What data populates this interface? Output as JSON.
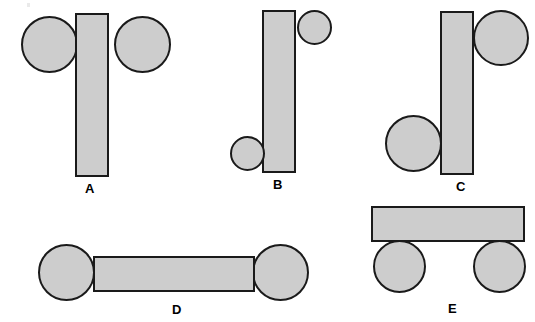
{
  "figure": {
    "title": "",
    "width": 535,
    "height": 322,
    "background_color": "#ffffff",
    "shape_fill_color": "#cdcdcd",
    "shape_outline_color": "#1a1a1a",
    "label_color": "#000000",
    "panels": [
      {
        "id": "A",
        "label": "A",
        "label_x": 85,
        "label_y": 182,
        "shapes": [
          {
            "name": "panel-a-left-circle",
            "type": "circle",
            "x": 21,
            "y": 16,
            "w": 57,
            "h": 57
          },
          {
            "name": "panel-a-right-circle",
            "type": "circle",
            "x": 114,
            "y": 16,
            "w": 57,
            "h": 57
          },
          {
            "name": "panel-a-bar",
            "type": "rect",
            "x": 75,
            "y": 13,
            "w": 34,
            "h": 164
          }
        ]
      },
      {
        "id": "B",
        "label": "B",
        "label_x": 273,
        "label_y": 178,
        "shapes": [
          {
            "name": "panel-b-bar",
            "type": "rect",
            "x": 262,
            "y": 10,
            "w": 34,
            "h": 163
          },
          {
            "name": "panel-b-top-right-circle",
            "type": "circle",
            "x": 297,
            "y": 10,
            "w": 35,
            "h": 35
          },
          {
            "name": "panel-b-bottom-left-circle",
            "type": "circle",
            "x": 230,
            "y": 136,
            "w": 35,
            "h": 35
          }
        ]
      },
      {
        "id": "C",
        "label": "C",
        "label_x": 456,
        "label_y": 180,
        "shapes": [
          {
            "name": "panel-c-bar",
            "type": "rect",
            "x": 440,
            "y": 11,
            "w": 34,
            "h": 164
          },
          {
            "name": "panel-c-top-right-circle",
            "type": "circle",
            "x": 473,
            "y": 10,
            "w": 56,
            "h": 56
          },
          {
            "name": "panel-c-bottom-left-circle",
            "type": "circle",
            "x": 385,
            "y": 115,
            "w": 57,
            "h": 57
          }
        ]
      },
      {
        "id": "D",
        "label": "D",
        "label_x": 172,
        "label_y": 303,
        "shapes": [
          {
            "name": "panel-d-left-circle",
            "type": "circle",
            "x": 38,
            "y": 244,
            "w": 57,
            "h": 57
          },
          {
            "name": "panel-d-right-circle",
            "type": "circle",
            "x": 252,
            "y": 244,
            "w": 57,
            "h": 57
          },
          {
            "name": "panel-d-bar",
            "type": "rect",
            "x": 93,
            "y": 256,
            "w": 162,
            "h": 36
          }
        ]
      },
      {
        "id": "E",
        "label": "E",
        "label_x": 448,
        "label_y": 302,
        "shapes": [
          {
            "name": "panel-e-bar",
            "type": "rect",
            "x": 371,
            "y": 206,
            "w": 154,
            "h": 36
          },
          {
            "name": "panel-e-left-circle",
            "type": "circle",
            "x": 373,
            "y": 240,
            "w": 53,
            "h": 53
          },
          {
            "name": "panel-e-right-circle",
            "type": "circle",
            "x": 473,
            "y": 240,
            "w": 53,
            "h": 53
          }
        ]
      }
    ]
  }
}
